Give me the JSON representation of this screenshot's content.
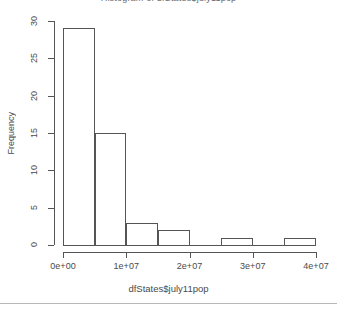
{
  "chart_data": {
    "type": "bar",
    "title": "Histogram of dfStates$july11pop",
    "xlabel": "dfStates$july11pop",
    "ylabel": "Frequency",
    "grid": false,
    "legend": "none",
    "bin_width": 5000000,
    "bin_edges": [
      0,
      5000000,
      10000000,
      15000000,
      20000000,
      25000000,
      30000000,
      35000000,
      40000000
    ],
    "categories": [
      "0-5e+06",
      "5e+06-1e+07",
      "1e+07-1.5e+07",
      "1.5e+07-2e+07",
      "2e+07-2.5e+07",
      "2.5e+07-3e+07",
      "3e+07-3.5e+07",
      "3.5e+07-4e+07"
    ],
    "values": [
      29,
      15,
      3,
      2,
      0,
      1,
      0,
      1
    ],
    "xlim": [
      0,
      40000000
    ],
    "ylim": [
      0,
      30
    ],
    "xticks": [
      0,
      10000000,
      20000000,
      30000000,
      40000000
    ],
    "xtick_labels": [
      "0e+00",
      "1e+07",
      "2e+07",
      "3e+07",
      "4e+07"
    ],
    "yticks": [
      0,
      5,
      10,
      15,
      20,
      25,
      30
    ],
    "ytick_labels": [
      "0",
      "5",
      "10",
      "15",
      "20",
      "25",
      "30"
    ]
  },
  "colors": {
    "bar_border": "#555555",
    "axis": "#555555",
    "text": "#4a4a4a",
    "background": "#ffffff",
    "divider": "#b8b8b8"
  }
}
